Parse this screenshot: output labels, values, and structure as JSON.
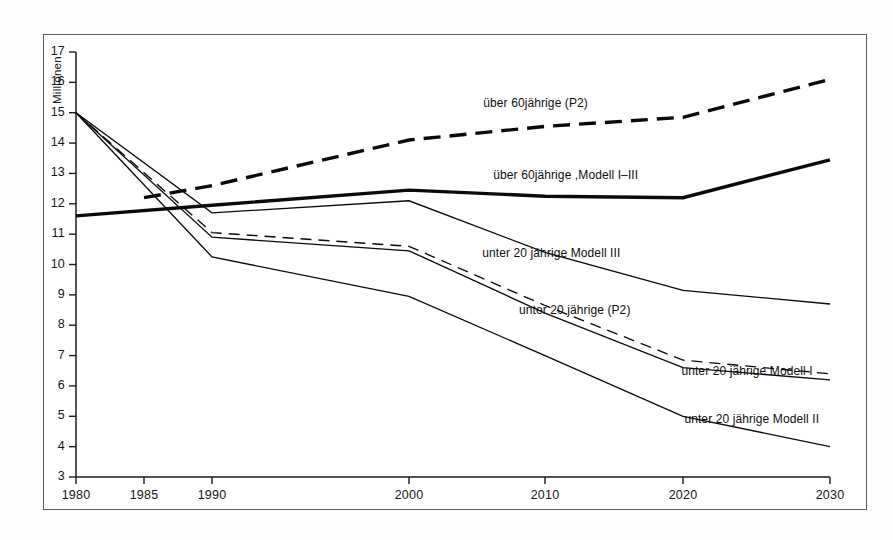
{
  "figure": {
    "axis_title_y": "Millionen",
    "frame": {
      "x": 43,
      "y": 34,
      "w": 824,
      "h": 476
    }
  },
  "chart_data": {
    "type": "line",
    "title": "",
    "xlabel": "",
    "ylabel": "Millionen",
    "x": [
      1980,
      1985,
      1990,
      2000,
      2010,
      2020,
      2030
    ],
    "xlim": [
      1980,
      2030
    ],
    "ylim": [
      3,
      17
    ],
    "yticks": [
      3,
      4,
      5,
      6,
      7,
      8,
      9,
      10,
      11,
      12,
      13,
      14,
      15,
      16,
      17
    ],
    "xticks": [
      1980,
      1985,
      1990,
      2000,
      2010,
      2020,
      2030
    ],
    "xtick_labels": [
      "1980",
      "1985",
      "1990",
      "2000",
      "2010",
      "2020",
      "2030"
    ],
    "grid": false,
    "legend": "inline-annotations",
    "axis_note": "x-axis spacing is non-uniform: 1980-1985-1990 use compressed 5-year steps, then 10-year steps to 2030",
    "series": [
      {
        "name": "über 60jährige (P2)",
        "style": "dashed",
        "width": "thick",
        "label_x": 1999,
        "label_y": 14.55,
        "x": [
          1985,
          1990,
          2000,
          2010,
          2020,
          2030
        ],
        "values": [
          12.2,
          12.6,
          14.1,
          14.55,
          14.85,
          16.1
        ]
      },
      {
        "name": "über 60jährige ,Modell I–III",
        "style": "solid",
        "width": "thick",
        "label_x": 1999,
        "label_y": 12.65,
        "x": [
          1980,
          1990,
          2000,
          2010,
          2020,
          2030
        ],
        "values": [
          11.6,
          11.95,
          12.45,
          12.25,
          12.2,
          13.45
        ]
      },
      {
        "name": "unter 20 jährige Modell III",
        "style": "solid",
        "width": "thin",
        "label_x": 1999,
        "label_y": 10.55,
        "x": [
          1980,
          1990,
          2000,
          2010,
          2020,
          2030
        ],
        "values": [
          15.0,
          11.7,
          12.1,
          10.4,
          9.15,
          8.7
        ]
      },
      {
        "name": "unter 20 jährige (P2)",
        "style": "dashed",
        "width": "thin",
        "label_x": 2000,
        "label_y": 8.6,
        "x": [
          1980,
          1990,
          2000,
          2010,
          2020,
          2030
        ],
        "values": [
          15.0,
          11.05,
          10.6,
          8.65,
          6.85,
          6.4
        ]
      },
      {
        "name": "unter 20 jährige  Modell I",
        "style": "solid",
        "width": "thin",
        "label_x": 2013,
        "label_y": 6.85,
        "x": [
          1980,
          1990,
          2000,
          2010,
          2020,
          2030
        ],
        "values": [
          15.0,
          10.9,
          10.45,
          8.4,
          6.6,
          6.2
        ]
      },
      {
        "name": "unter 20 jährige  Modell II",
        "style": "solid",
        "width": "thin",
        "label_x": 2013,
        "label_y": 5.2,
        "x": [
          1980,
          1990,
          2000,
          2010,
          2020,
          2030
        ],
        "values": [
          15.0,
          10.25,
          8.95,
          7.0,
          5.0,
          4.0
        ]
      }
    ]
  }
}
